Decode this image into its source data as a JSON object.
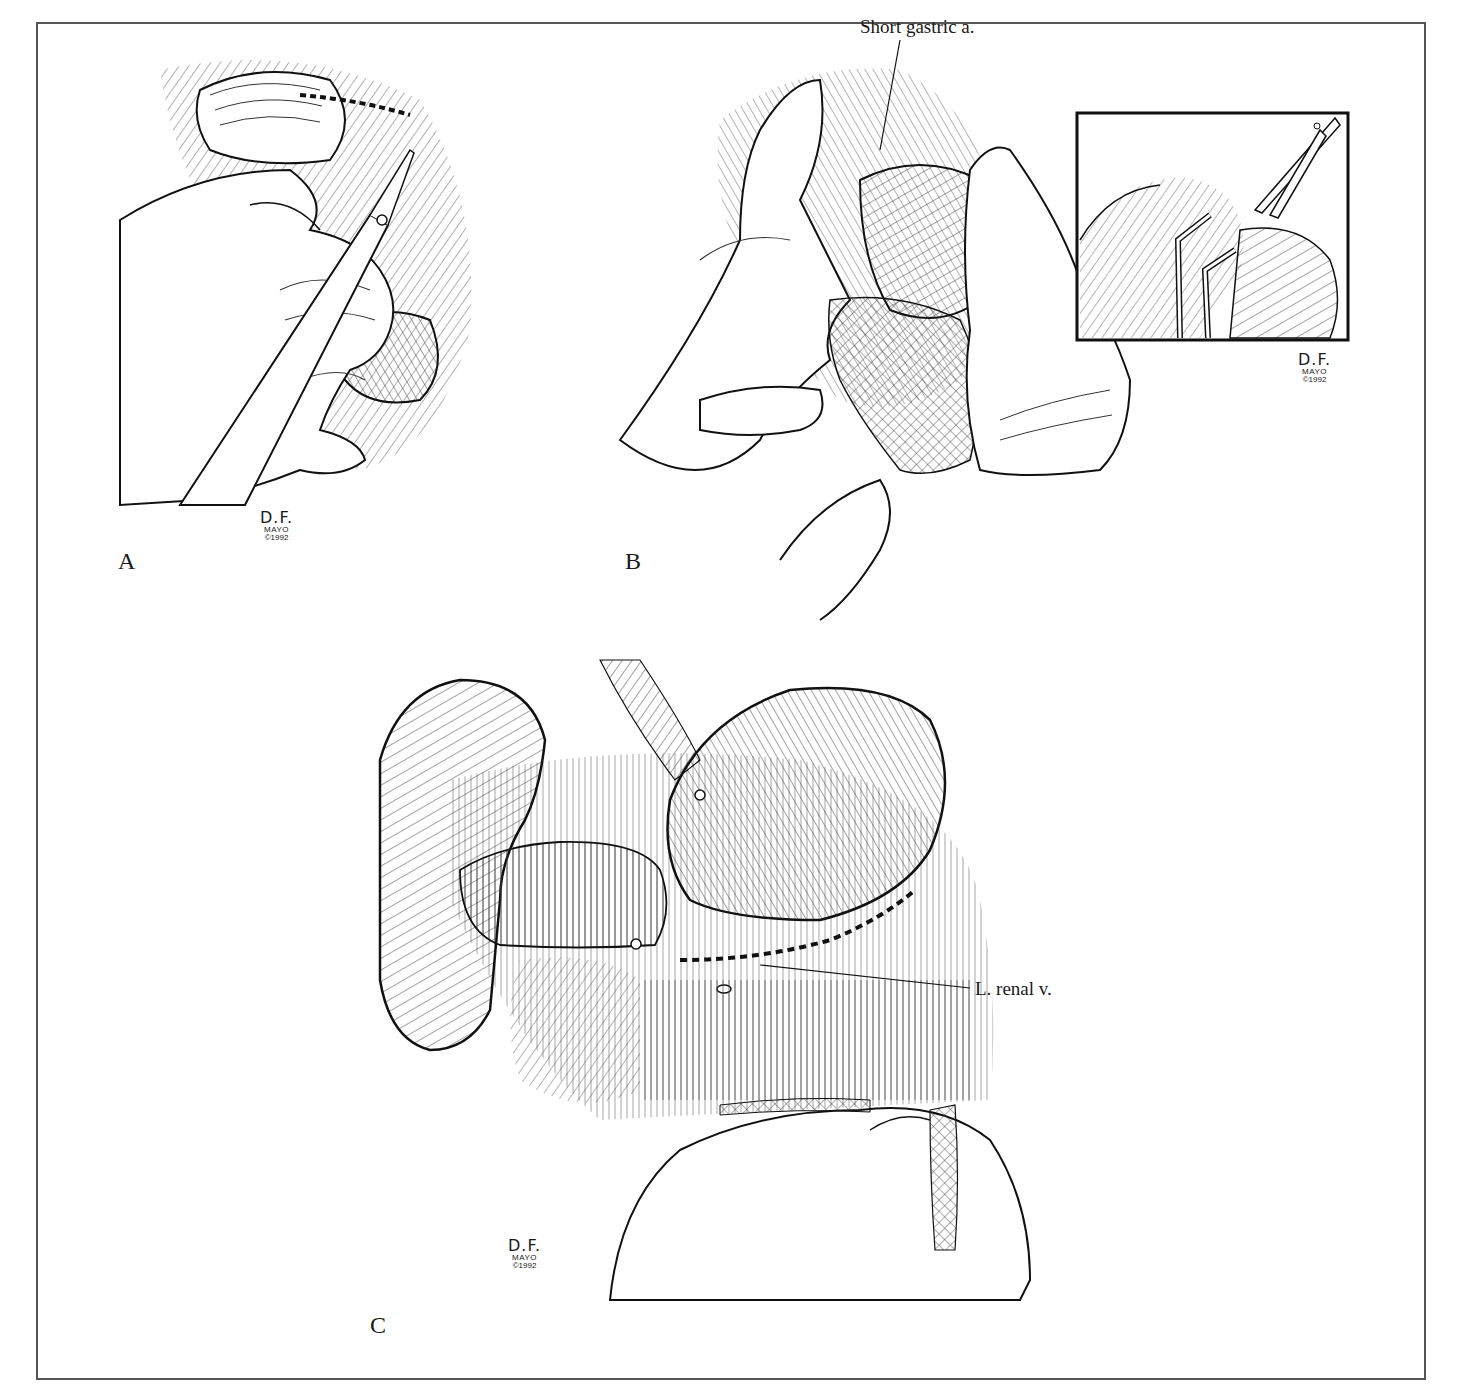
{
  "figure": {
    "panels": [
      {
        "id": "A",
        "label": "A"
      },
      {
        "id": "B",
        "label": "B"
      },
      {
        "id": "C",
        "label": "C"
      }
    ],
    "callouts": {
      "short_gastric": "Short gastric a.",
      "renal_vein": "L. renal v."
    },
    "signature": {
      "initials": "D.F.",
      "org": "MAYO",
      "year": "©1992"
    },
    "colors": {
      "ink": "#1a1a1a",
      "frame": "#555555",
      "background": "#ffffff"
    }
  }
}
